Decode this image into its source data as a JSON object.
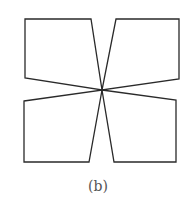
{
  "figure": {
    "caption": "(b)",
    "stroke_color": "#2a2a2a",
    "background": "#ffffff",
    "center": [
      102,
      90
    ],
    "quadrilaterals": [
      {
        "name": "top-left",
        "points": [
          [
            25,
            19
          ],
          [
            91,
            19
          ],
          [
            102,
            90
          ],
          [
            25,
            78
          ]
        ]
      },
      {
        "name": "top-right",
        "points": [
          [
            116,
            19
          ],
          [
            179,
            19
          ],
          [
            179,
            79
          ],
          [
            102,
            90
          ]
        ]
      },
      {
        "name": "bottom-left",
        "points": [
          [
            24,
            101
          ],
          [
            102,
            90
          ],
          [
            89,
            162
          ],
          [
            24,
            162
          ]
        ]
      },
      {
        "name": "bottom-right",
        "points": [
          [
            102,
            90
          ],
          [
            176,
            100
          ],
          [
            176,
            162
          ],
          [
            114,
            162
          ]
        ]
      }
    ]
  }
}
